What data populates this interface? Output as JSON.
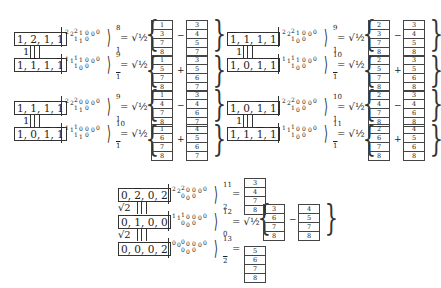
{
  "blocks": [
    {
      "id": "top-left",
      "top": {
        "label": [
          "1",
          "2̄",
          "1",
          "1"
        ],
        "ket_top": "2 2 2 1 0 0 0",
        "ket_bot": "1 1 0",
        "sup": "8",
        "sub": "1",
        "coef": "√½",
        "op": "−",
        "left_col": [
          "1",
          "3",
          "7",
          "8"
        ],
        "right_col": [
          "3",
          "4",
          "5",
          "7"
        ]
      },
      "link": "1",
      "bottom": {
        "label": [
          "1",
          "1̄",
          "1",
          "1̄"
        ],
        "ket_top": "1 1 1 1 0 0 0",
        "ket_bot": "1 1 0",
        "sup": "9",
        "sub": "1̄",
        "coef": "√½",
        "op": "+",
        "left_col": [
          "1",
          "5",
          "7",
          "8"
        ],
        "right_col": [
          "3",
          "5",
          "6",
          "7"
        ]
      }
    },
    {
      "id": "top-right",
      "top": {
        "label": [
          "1̄",
          "1̄",
          "1",
          "1"
        ],
        "ket_top": "2 2 2 1 0 0 0",
        "ket_bot": "1 0 0",
        "sup": "9",
        "sub": "1",
        "coef": "√½",
        "op": "−",
        "left_col": [
          "2",
          "3",
          "7",
          "8"
        ],
        "right_col": [
          "3",
          "4",
          "5",
          "8"
        ]
      },
      "link": "1",
      "bottom": {
        "label": [
          "1̄",
          "0",
          "1",
          "1̄"
        ],
        "ket_top": "1 1 1 1 0 0 0",
        "ket_bot": "1 0 0",
        "sup": "10",
        "sub": "1̄",
        "coef": "√½",
        "op": "+",
        "left_col": [
          "2",
          "5",
          "7",
          "8"
        ],
        "right_col": [
          "3",
          "5",
          "6",
          "8"
        ]
      }
    },
    {
      "id": "mid-left",
      "top": {
        "label": [
          "1",
          "1̄",
          "1̄",
          "1"
        ],
        "ket_top": "2 2 2 0 0 0 0",
        "ket_bot": "1 1 0",
        "sup": "9",
        "sub": "1",
        "coef": "√½",
        "op": "−",
        "left_col": [
          "1",
          "4",
          "7",
          "8"
        ],
        "right_col": [
          "3",
          "4",
          "6",
          "7"
        ]
      },
      "link": "1",
      "bottom": {
        "label": [
          "1",
          "0",
          "1̄",
          "1̄"
        ],
        "ket_top": "1 1 1 0 0 0 0",
        "ket_bot": "1 1 0",
        "sup": "10",
        "sub": "1̄",
        "coef": "√½",
        "op": "+",
        "left_col": [
          "1",
          "6",
          "7",
          "8"
        ],
        "right_col": [
          "4",
          "5",
          "6",
          "7"
        ]
      }
    },
    {
      "id": "mid-right",
      "top": {
        "label": [
          "1̄",
          "0",
          "1̄",
          "1"
        ],
        "ket_top": "2 2 2 0 0 0 0",
        "ket_bot": "1 0 0",
        "sup": "10",
        "sub": "1",
        "coef": "√½",
        "op": "−",
        "left_col": [
          "2",
          "4",
          "7",
          "8"
        ],
        "right_col": [
          "3",
          "4",
          "6",
          "8"
        ]
      },
      "link": "1",
      "bottom": {
        "label": [
          "1̄",
          "1",
          "1̄",
          "1̄"
        ],
        "ket_top": "1 1 1 0 0 0 0",
        "ket_bot": "1 0 0",
        "sup": "11",
        "sub": "1̄",
        "coef": "√½",
        "op": "+",
        "left_col": [
          "2",
          "6",
          "7",
          "8"
        ],
        "right_col": [
          "4",
          "5",
          "6",
          "8"
        ]
      }
    }
  ],
  "bottom_chain": {
    "rows": [
      {
        "label": [
          "0",
          "2̄",
          "0",
          "2"
        ],
        "ket_top": "2 2 2 0 0 0 0",
        "ket_bot": "0 0 0",
        "sup": "11",
        "sub": "2",
        "rhs": "=",
        "single_col": [
          "3",
          "4",
          "7",
          "8"
        ]
      },
      {
        "label": [
          "0",
          "1̄",
          "0",
          "0"
        ],
        "ket_top": "1 1 1 0 0 0 0",
        "ket_bot": "0 0 0",
        "sup": "12",
        "sub": "0",
        "coef": "√½",
        "op": "−",
        "left_col": [
          "3",
          "6",
          "7",
          "8"
        ],
        "right_col": [
          "4",
          "5",
          "7",
          "8"
        ]
      },
      {
        "label": [
          "0",
          "0",
          "0",
          "2̄"
        ],
        "ket_top": "0 0 0 0 0 0 0",
        "ket_bot": "0 0 0",
        "sup": "13",
        "sub": "2̄",
        "rhs": "=",
        "single_col": [
          "5",
          "6",
          "7",
          "8"
        ]
      }
    ],
    "links": [
      "√2",
      "√2"
    ]
  },
  "symbols": {
    "equals": "=",
    "lbrace": "{",
    "rbrace": "}",
    "langle_bar": "|",
    "rangle": "⟩"
  }
}
